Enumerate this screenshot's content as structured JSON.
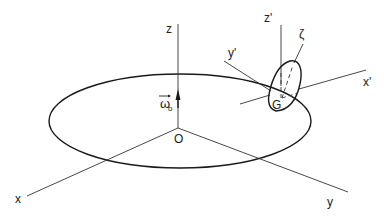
{
  "figure": {
    "type": "3D coordinate frame diagram with rotating body on a circular orbit",
    "labels": {
      "z": "z",
      "x": "x",
      "y": "y",
      "origin": "O",
      "omega": "ω",
      "omega_sub": "o",
      "z_prime": "z'",
      "y_prime": "y'",
      "x_prime": "x'",
      "zeta": "ζ",
      "center_of_mass": "G"
    }
  }
}
